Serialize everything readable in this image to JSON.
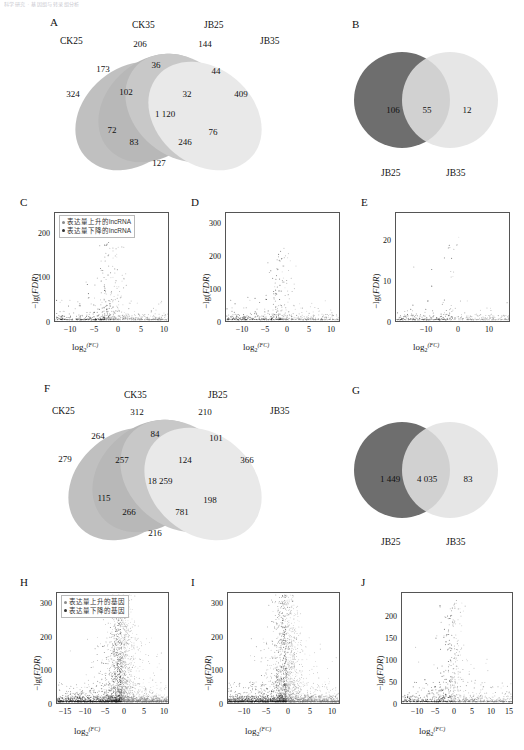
{
  "header": {
    "running_text": "科学研究 · 基因组与转录组分析"
  },
  "panels": {
    "A": {
      "letter": "A",
      "type": "venn4",
      "set_labels": [
        "CK25",
        "CK35",
        "JB25",
        "JB35"
      ],
      "regions": [
        {
          "id": "CK35_only",
          "value": "206"
        },
        {
          "id": "JB25_only",
          "value": "144"
        },
        {
          "id": "CK25_CK35",
          "value": "173"
        },
        {
          "id": "CK35_JB25",
          "value": "36"
        },
        {
          "id": "JB25_JB35",
          "value": "44"
        },
        {
          "id": "CK25_only",
          "value": "324"
        },
        {
          "id": "CK25_CK35_JB25",
          "value": "102"
        },
        {
          "id": "CK35_JB25_JB35",
          "value": "32"
        },
        {
          "id": "JB35_only",
          "value": "409"
        },
        {
          "id": "all_four",
          "value": "1 120"
        },
        {
          "id": "CK25_CK35_JB35",
          "value": "72"
        },
        {
          "id": "CK25_JB25_JB35",
          "value": "76"
        },
        {
          "id": "CK25_JB35",
          "value": "83"
        },
        {
          "id": "CK35_JB35",
          "value": "246"
        },
        {
          "id": "CK25_JB25",
          "value": "127"
        }
      ]
    },
    "B": {
      "letter": "B",
      "type": "venn2",
      "set_labels": [
        "JB25",
        "JB35"
      ],
      "regions": [
        {
          "id": "left_only",
          "value": "106"
        },
        {
          "id": "intersection",
          "value": "55"
        },
        {
          "id": "right_only",
          "value": "12"
        }
      ]
    },
    "C": {
      "letter": "C",
      "type": "scatter",
      "legend": [
        "表达量上升的lncRNA",
        "表达量下降的lncRNA"
      ],
      "ylabel": "−lg(FDR)",
      "xlabel": "log2(FC)",
      "yticks": [
        "0",
        "100",
        "200"
      ],
      "xticks": [
        "−10",
        "−5",
        "0",
        "5",
        "10"
      ]
    },
    "D": {
      "letter": "D",
      "type": "scatter",
      "ylabel": "−lg(FDR)",
      "xlabel": "log2(FC)",
      "yticks": [
        "0",
        "100",
        "200",
        "300"
      ],
      "xticks": [
        "−10",
        "−5",
        "0",
        "5",
        "10"
      ]
    },
    "E": {
      "letter": "E",
      "type": "scatter",
      "ylabel": "−lg(FDR)",
      "xlabel": "log2(FC)",
      "yticks": [
        "0",
        "10",
        "20"
      ],
      "xticks": [
        "−10",
        "0",
        "10"
      ]
    },
    "F": {
      "letter": "F",
      "type": "venn4",
      "set_labels": [
        "CK25",
        "CK35",
        "JB25",
        "JB35"
      ],
      "regions": [
        {
          "id": "CK35_only",
          "value": "312"
        },
        {
          "id": "JB25_only",
          "value": "210"
        },
        {
          "id": "CK25_CK35",
          "value": "264"
        },
        {
          "id": "CK35_JB25",
          "value": "84"
        },
        {
          "id": "JB25_JB35",
          "value": "101"
        },
        {
          "id": "CK25_only",
          "value": "279"
        },
        {
          "id": "CK25_CK35_JB25",
          "value": "257"
        },
        {
          "id": "CK35_JB25_JB35",
          "value": "124"
        },
        {
          "id": "JB35_only",
          "value": "366"
        },
        {
          "id": "all_four",
          "value": "18 259"
        },
        {
          "id": "CK25_CK35_JB35",
          "value": "115"
        },
        {
          "id": "CK25_JB25_JB35",
          "value": "198"
        },
        {
          "id": "CK25_JB35",
          "value": "266"
        },
        {
          "id": "CK35_JB35",
          "value": "781"
        },
        {
          "id": "CK25_JB25",
          "value": "216"
        }
      ]
    },
    "G": {
      "letter": "G",
      "type": "venn2",
      "set_labels": [
        "JB25",
        "JB35"
      ],
      "regions": [
        {
          "id": "left_only",
          "value": "1 449"
        },
        {
          "id": "intersection",
          "value": "4 035"
        },
        {
          "id": "right_only",
          "value": "83"
        }
      ]
    },
    "H": {
      "letter": "H",
      "type": "scatter",
      "legend": [
        "表达量上升的基因",
        "表达量下降的基因"
      ],
      "ylabel": "−lg(FDR)",
      "xlabel": "log2(FC)",
      "yticks": [
        "0",
        "100",
        "200",
        "300"
      ],
      "xticks": [
        "−15",
        "−10",
        "−5",
        "0",
        "5",
        "10"
      ]
    },
    "I": {
      "letter": "I",
      "type": "scatter",
      "ylabel": "−lg(FDR)",
      "xlabel": "log2(FC)",
      "yticks": [
        "0",
        "100",
        "200",
        "300"
      ],
      "xticks": [
        "−10",
        "−5",
        "0",
        "5",
        "10"
      ]
    },
    "J": {
      "letter": "J",
      "type": "scatter",
      "ylabel": "−lg(FDR)",
      "xlabel": "log2(FC)",
      "yticks": [
        "0",
        "50",
        "100",
        "150",
        "200"
      ],
      "xticks": [
        "−10",
        "−5",
        "0",
        "5",
        "10",
        "15"
      ]
    }
  },
  "colors": {
    "ellipse_ck25": "#9b9b9b",
    "ellipse_ck35": "#8e8e8e",
    "ellipse_jb25": "#a8a8a8",
    "ellipse_jb35": "#dcdcdc",
    "circle_dark": "#6e6e6e",
    "circle_light": "#e2e2e2",
    "axis": "#555555",
    "point_up": "#777777",
    "point_down": "#222222"
  },
  "chart_data": [
    {
      "id": "C",
      "type": "scatter",
      "title": "C",
      "xlabel": "log2(FC)",
      "ylabel": "−lg(FDR)",
      "xlim": [
        -12.5,
        11.5
      ],
      "ylim": [
        0,
        240
      ],
      "xticks": [
        -10,
        -5,
        0,
        5,
        10
      ],
      "yticks": [
        0,
        100,
        200
      ],
      "grid": false,
      "n_points": 430,
      "description": "Volcano plot of lncRNA: dense low-FDR band near y=0 spanning full x range, sparse plume up to ~160 between x=-4 and x=4",
      "series": [
        {
          "name": "表达量上升的lncRNA",
          "color": "#777777"
        },
        {
          "name": "表达量下降的lncRNA",
          "color": "#222222"
        }
      ]
    },
    {
      "id": "D",
      "type": "scatter",
      "title": "D",
      "xlabel": "log2(FC)",
      "ylabel": "−lg(FDR)",
      "xlim": [
        -11.5,
        13
      ],
      "ylim": [
        0,
        310
      ],
      "xticks": [
        -10,
        -5,
        0,
        5,
        10
      ],
      "yticks": [
        0,
        100,
        200,
        300
      ],
      "grid": false,
      "n_points": 330,
      "description": "Volcano plot: dense band at y<20 across x, narrow vertical plume near x=0..2 rising to ~190"
    },
    {
      "id": "E",
      "type": "scatter",
      "title": "E",
      "xlabel": "log2(FC)",
      "ylabel": "−lg(FDR)",
      "xlim": [
        -18,
        17
      ],
      "ylim": [
        0,
        27
      ],
      "xticks": [
        -10,
        0,
        10
      ],
      "yticks": [
        0,
        10,
        20
      ],
      "grid": false,
      "n_points": 120,
      "description": "Sparse volcano: clusters near x=-16, x=-3..3 and x=10..15, most y<5, a few points up to 26"
    },
    {
      "id": "H",
      "type": "scatter",
      "title": "H",
      "xlabel": "log2(FC)",
      "ylabel": "−lg(FDR)",
      "xlim": [
        -16,
        11
      ],
      "ylim": [
        0,
        320
      ],
      "xticks": [
        -15,
        -10,
        -5,
        0,
        5,
        10
      ],
      "yticks": [
        0,
        100,
        200,
        300
      ],
      "grid": false,
      "n_points": 2600,
      "description": "Dense gene volcano plot: very dense dark column at x=0..1 rising to ~300, broad cloud from x=-10 to 8",
      "series": [
        {
          "name": "表达量上升的基因",
          "color": "#777777"
        },
        {
          "name": "表达量下降的基因",
          "color": "#222222"
        }
      ]
    },
    {
      "id": "I",
      "type": "scatter",
      "title": "I",
      "xlabel": "log2(FC)",
      "ylabel": "−lg(FDR)",
      "xlim": [
        -12,
        12.5
      ],
      "ylim": [
        0,
        320
      ],
      "xticks": [
        -10,
        -5,
        0,
        5,
        10
      ],
      "yticks": [
        0,
        100,
        200,
        300
      ],
      "grid": false,
      "n_points": 2300,
      "description": "Dense gene volcano: tall dark columns at x≈0 and x≈2 reaching 300, wide scatter cloud"
    },
    {
      "id": "J",
      "type": "scatter",
      "title": "J",
      "xlabel": "log2(FC)",
      "ylabel": "−lg(FDR)",
      "xlim": [
        -13,
        16
      ],
      "ylim": [
        0,
        230
      ],
      "xticks": [
        -10,
        -5,
        0,
        5,
        10,
        15
      ],
      "yticks": [
        0,
        50,
        100,
        150,
        200
      ],
      "grid": false,
      "n_points": 700,
      "description": "Volcano: dense flat band y<10 from x=-5 to 12, sparse plume to ~210 near x=0"
    },
    {
      "id": "A",
      "type": "venn",
      "title": "A",
      "sets": [
        "CK25",
        "CK35",
        "JB25",
        "JB35"
      ],
      "counts": {
        "CK25": 324,
        "CK35": 206,
        "JB25": 144,
        "JB35": 409,
        "CK25&CK35": 173,
        "CK35&JB25": 36,
        "JB25&JB35": 44,
        "CK25&JB25": 127,
        "CK25&JB35": 83,
        "CK35&JB35": 246,
        "CK25&CK35&JB25": 102,
        "CK35&JB25&JB35": 32,
        "CK25&CK35&JB35": 72,
        "CK25&JB25&JB35": 76,
        "CK25&CK35&JB25&JB35": 1120
      }
    },
    {
      "id": "B",
      "type": "venn",
      "title": "B",
      "sets": [
        "JB25",
        "JB35"
      ],
      "counts": {
        "JB25": 106,
        "JB25&JB35": 55,
        "JB35": 12
      }
    },
    {
      "id": "F",
      "type": "venn",
      "title": "F",
      "sets": [
        "CK25",
        "CK35",
        "JB25",
        "JB35"
      ],
      "counts": {
        "CK25": 279,
        "CK35": 312,
        "JB25": 210,
        "JB35": 366,
        "CK25&CK35": 264,
        "CK35&JB25": 84,
        "JB25&JB35": 101,
        "CK25&JB25": 216,
        "CK25&JB35": 266,
        "CK35&JB35": 781,
        "CK25&CK35&JB25": 257,
        "CK35&JB25&JB35": 124,
        "CK25&CK35&JB35": 115,
        "CK25&JB25&JB35": 198,
        "CK25&CK35&JB25&JB35": 18259
      }
    },
    {
      "id": "G",
      "type": "venn",
      "title": "G",
      "sets": [
        "JB25",
        "JB35"
      ],
      "counts": {
        "JB25": 1449,
        "JB25&JB35": 4035,
        "JB35": 83
      }
    }
  ]
}
